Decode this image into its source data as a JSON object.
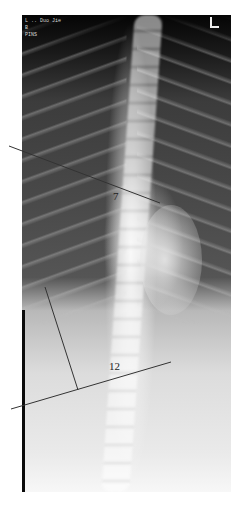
{
  "image": {
    "description": "Posteroanterior spine radiograph with Cobb angle measurement lines",
    "header_text_lines": [
      "L .. Duo Jie",
      "B",
      "PINS"
    ],
    "side_marker": "L"
  },
  "annotations": {
    "upper_vertebra_label": "7",
    "lower_vertebra_label": "12",
    "upper_line": {
      "x1": 9,
      "y1": 146,
      "x2": 160,
      "y2": 203
    },
    "lower_line": {
      "x1": 11,
      "y1": 409,
      "x2": 171,
      "y2": 362
    },
    "perpendicular_line": {
      "x1": 45,
      "y1": 287,
      "x2": 78,
      "y2": 390
    },
    "line_color": "#333333"
  }
}
